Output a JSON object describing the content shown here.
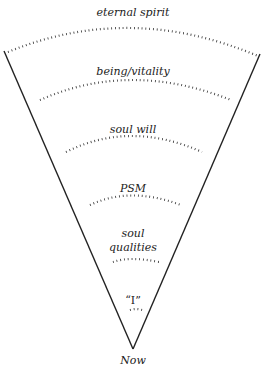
{
  "diagram": {
    "type": "funnel",
    "apex_label": "Now",
    "levels": [
      {
        "label": "eternal spirit"
      },
      {
        "label": "being/vitality"
      },
      {
        "label": "soul will"
      },
      {
        "label": "PSM"
      },
      {
        "label": "soul"
      },
      {
        "label": "qualities"
      },
      {
        "label": "“I”"
      }
    ]
  }
}
